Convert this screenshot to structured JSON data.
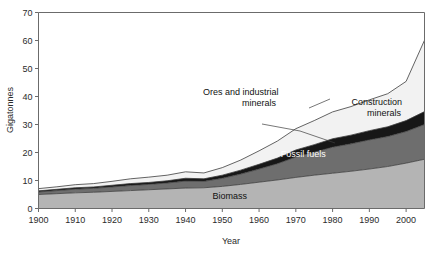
{
  "chart_data": {
    "type": "area",
    "stacked": true,
    "title": "",
    "xlabel": "Year",
    "ylabel": "Gigatonnes",
    "xlim": [
      1900,
      2005
    ],
    "ylim": [
      0,
      70
    ],
    "grid": false,
    "legend_position": "in-plot-labels",
    "xticks": [
      1900,
      1910,
      1920,
      1930,
      1940,
      1950,
      1960,
      1970,
      1980,
      1990,
      2000
    ],
    "yticks": [
      0,
      10,
      20,
      30,
      40,
      50,
      60,
      70
    ],
    "x": [
      1900,
      1905,
      1910,
      1915,
      1920,
      1925,
      1930,
      1935,
      1940,
      1945,
      1950,
      1955,
      1960,
      1965,
      1970,
      1975,
      1980,
      1985,
      1990,
      1995,
      2000,
      2005
    ],
    "series": [
      {
        "name": "Biomass",
        "color": "#b4b4b4",
        "values": [
          5.0,
          5.3,
          5.6,
          5.8,
          6.1,
          6.4,
          6.7,
          7.0,
          7.3,
          7.4,
          7.9,
          8.6,
          9.4,
          10.2,
          11.1,
          11.9,
          12.6,
          13.3,
          14.1,
          15.0,
          16.2,
          17.6
        ]
      },
      {
        "name": "Fossil fuels",
        "color": "#6e6e6e",
        "values": [
          0.9,
          1.1,
          1.3,
          1.4,
          1.6,
          1.8,
          1.9,
          2.1,
          2.5,
          2.3,
          2.9,
          3.7,
          4.7,
          5.8,
          7.3,
          8.2,
          9.3,
          9.8,
          10.4,
          10.7,
          11.3,
          12.4
        ]
      },
      {
        "name": "Ores and industrial minerals",
        "color": "#171717",
        "values": [
          0.4,
          0.45,
          0.5,
          0.5,
          0.6,
          0.7,
          0.7,
          0.8,
          1.0,
          0.9,
          1.1,
          1.4,
          1.7,
          2.0,
          2.5,
          2.7,
          3.0,
          3.1,
          3.3,
          3.5,
          3.9,
          4.6
        ]
      },
      {
        "name": "Construction minerals",
        "color": "#f2f2f2",
        "values": [
          0.8,
          0.9,
          1.1,
          1.2,
          1.4,
          1.7,
          1.9,
          2.0,
          2.3,
          2.1,
          2.7,
          3.6,
          4.8,
          6.1,
          7.6,
          8.6,
          9.6,
          10.2,
          11.0,
          11.8,
          14.0,
          25.5
        ]
      }
    ],
    "totals": [
      7.1,
      7.75,
      8.5,
      8.9,
      9.7,
      10.6,
      11.2,
      11.9,
      13.1,
      12.7,
      14.6,
      17.3,
      20.6,
      24.1,
      28.5,
      31.4,
      34.5,
      36.4,
      38.8,
      41.0,
      45.4,
      60.1
    ],
    "annotations": [
      {
        "name": "biomass-label",
        "text": "Biomass",
        "x": 1952,
        "y": 3.5
      },
      {
        "name": "fossil-fuels-label",
        "text": "Fossil fuels",
        "x": 1972,
        "y": 18.5
      },
      {
        "name": "ores-label-line1",
        "text": "Ores and industrial",
        "x": 1955,
        "y": 40.5
      },
      {
        "name": "ores-label-line2",
        "text": "minerals",
        "x": 1960,
        "y": 36.5
      },
      {
        "name": "construction-label-line1",
        "text": "Construction",
        "x": 1992,
        "y": 37.0
      },
      {
        "name": "construction-label-line2",
        "text": "minerals",
        "x": 1994,
        "y": 33.0
      }
    ]
  },
  "axes": {
    "y_title": "Gigatonnes",
    "x_title": "Year",
    "y_tick_labels": [
      "0",
      "10",
      "20",
      "30",
      "40",
      "50",
      "60",
      "70"
    ],
    "x_tick_labels": [
      "1900",
      "1910",
      "1920",
      "1930",
      "1940",
      "1950",
      "1960",
      "1970",
      "1980",
      "1990",
      "2000"
    ]
  },
  "labels": {
    "biomass": "Biomass",
    "fossil_fuels": "Fossil fuels",
    "ores_line1": "Ores and industrial",
    "ores_line2": "minerals",
    "construction_line1": "Construction",
    "construction_line2": "minerals"
  },
  "colors": {
    "biomass": "#b4b4b4",
    "fossil_fuels": "#6e6e6e",
    "ores": "#171717",
    "construction": "#f2f2f2",
    "axis": "#6b6b6b",
    "outline": "#3c3c3c"
  }
}
